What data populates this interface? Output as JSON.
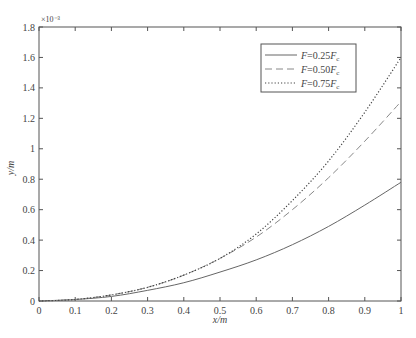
{
  "chart_data": {
    "type": "line",
    "title": "",
    "xlabel": "x/m",
    "ylabel": "y/m",
    "y_multiplier": "×10⁻³",
    "xlim": [
      0,
      1
    ],
    "ylim": [
      0,
      1.8
    ],
    "grid": false,
    "legend_position": "upper right (inside)",
    "x_ticks": [
      "0",
      "0.1",
      "0.2",
      "0.3",
      "0.4",
      "0.5",
      "0.6",
      "0.7",
      "0.8",
      "0.9",
      "1"
    ],
    "y_ticks": [
      "0",
      "0.2",
      "0.4",
      "0.6",
      "0.8",
      "1",
      "1.2",
      "1.4",
      "1.6",
      "1.8"
    ],
    "x": [
      0,
      0.1,
      0.2,
      0.3,
      0.4,
      0.5,
      0.6,
      0.7,
      0.8,
      0.9,
      1.0
    ],
    "series": [
      {
        "name": "F=0.25Fc",
        "style": "solid",
        "values": [
          0,
          0.01,
          0.03,
          0.07,
          0.12,
          0.19,
          0.27,
          0.37,
          0.49,
          0.63,
          0.78
        ]
      },
      {
        "name": "F=0.50Fc",
        "style": "dashed",
        "values": [
          0,
          0.01,
          0.04,
          0.09,
          0.17,
          0.28,
          0.42,
          0.6,
          0.81,
          1.05,
          1.31
        ]
      },
      {
        "name": "F=0.75Fc",
        "style": "dotted",
        "values": [
          0,
          0.01,
          0.04,
          0.09,
          0.17,
          0.28,
          0.44,
          0.66,
          0.92,
          1.24,
          1.6
        ]
      }
    ]
  },
  "legend": {
    "items": [
      {
        "prefix": "F",
        "eq": "=0.25",
        "suffix": "F",
        "sub": "c"
      },
      {
        "prefix": "F",
        "eq": "=0.50",
        "suffix": "F",
        "sub": "c"
      },
      {
        "prefix": "F",
        "eq": "=0.75",
        "suffix": "F",
        "sub": "c"
      }
    ]
  },
  "colors": {
    "axis": "#555555",
    "solid": "#666666",
    "dashed": "#888888",
    "dotted": "#444444"
  }
}
